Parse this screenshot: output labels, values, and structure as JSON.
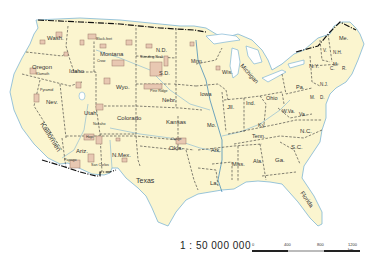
{
  "map": {
    "title": "United States — Indian reservations",
    "colors": {
      "land": "#fbf5cf",
      "water": "#9fd0e6",
      "coast": "#7fb6d4",
      "reservation": "#e8c8b2",
      "reservation_edge": "#9a7a6a",
      "state_border": "#333333",
      "intl_border": "#111111"
    },
    "states": [
      {
        "name": "Wash.",
        "x": 47,
        "y": 40,
        "size": 6
      },
      {
        "name": "Oregon",
        "x": 32,
        "y": 69,
        "size": 6
      },
      {
        "name": "Idaho",
        "x": 69,
        "y": 73,
        "size": 6
      },
      {
        "name": "Montana",
        "x": 100,
        "y": 56,
        "size": 6
      },
      {
        "name": "Wyo.",
        "x": 116,
        "y": 89,
        "size": 6
      },
      {
        "name": "N.D.",
        "x": 156,
        "y": 52,
        "size": 5.5
      },
      {
        "name": "S.D.",
        "x": 159,
        "y": 75,
        "size": 5.5
      },
      {
        "name": "Nebr.",
        "x": 162,
        "y": 102,
        "size": 6
      },
      {
        "name": "Minn.",
        "x": 191,
        "y": 63,
        "size": 5
      },
      {
        "name": "Wis.",
        "x": 222,
        "y": 74,
        "size": 5.5
      },
      {
        "name": "Iowa",
        "x": 200,
        "y": 96,
        "size": 5.5
      },
      {
        "name": "Nev.",
        "x": 46,
        "y": 104,
        "size": 6
      },
      {
        "name": "Utah",
        "x": 84,
        "y": 115,
        "size": 6
      },
      {
        "name": "Colorado",
        "x": 117,
        "y": 120,
        "size": 6
      },
      {
        "name": "Kansas",
        "x": 166,
        "y": 124,
        "size": 6
      },
      {
        "name": "Mo.",
        "x": 207,
        "y": 127,
        "size": 5.5
      },
      {
        "name": "Jll.",
        "x": 227,
        "y": 109,
        "size": 6
      },
      {
        "name": "Ind.",
        "x": 246,
        "y": 105,
        "size": 5.5
      },
      {
        "name": "Ohio",
        "x": 266,
        "y": 100,
        "size": 5.5
      },
      {
        "name": "Pa.",
        "x": 296,
        "y": 89,
        "size": 5.5
      },
      {
        "name": "N.Y.",
        "x": 309,
        "y": 68,
        "size": 5.5
      },
      {
        "name": "Me.",
        "x": 339,
        "y": 40,
        "size": 5.5
      },
      {
        "name": "Ky.",
        "x": 258,
        "y": 127,
        "size": 5.5
      },
      {
        "name": "W.Va.",
        "x": 282,
        "y": 113,
        "size": 5
      },
      {
        "name": "Va.",
        "x": 299,
        "y": 116,
        "size": 5
      },
      {
        "name": "Tenn.",
        "x": 252,
        "y": 138,
        "size": 5.5
      },
      {
        "name": "N.C.",
        "x": 300,
        "y": 133,
        "size": 6
      },
      {
        "name": "S.C.",
        "x": 291,
        "y": 149,
        "size": 6
      },
      {
        "name": "Ga.",
        "x": 275,
        "y": 162,
        "size": 6
      },
      {
        "name": "Ala.",
        "x": 253,
        "y": 163,
        "size": 5.5
      },
      {
        "name": "Miss.",
        "x": 232,
        "y": 166,
        "size": 5.5
      },
      {
        "name": "Ark.",
        "x": 211,
        "y": 152,
        "size": 5.5
      },
      {
        "name": "La.",
        "x": 210,
        "y": 185,
        "size": 6
      },
      {
        "name": "Okla.",
        "x": 169,
        "y": 150,
        "size": 6
      },
      {
        "name": "Texas",
        "x": 136,
        "y": 183,
        "size": 7
      },
      {
        "name": "N.Mex.",
        "x": 112,
        "y": 157,
        "size": 6
      },
      {
        "name": "Ariz.",
        "x": 76,
        "y": 153,
        "size": 6
      }
    ],
    "rotated_labels": [
      {
        "name": "Kalifornien",
        "x": 40,
        "y": 124,
        "rotate": 58,
        "size": 7
      },
      {
        "name": "Michigan",
        "x": 240,
        "y": 66,
        "rotate": 48,
        "size": 6
      },
      {
        "name": "Florida",
        "x": 300,
        "y": 193,
        "rotate": 55,
        "size": 6
      }
    ],
    "small_labels": [
      {
        "name": "V.",
        "x": 323,
        "y": 52
      },
      {
        "name": "N.H.",
        "x": 333,
        "y": 54
      },
      {
        "name": "M.",
        "x": 333,
        "y": 66
      },
      {
        "name": "C.",
        "x": 330,
        "y": 70
      },
      {
        "name": "R.",
        "x": 342,
        "y": 70
      },
      {
        "name": "N.J.",
        "x": 320,
        "y": 86
      },
      {
        "name": "M.",
        "x": 310,
        "y": 99
      },
      {
        "name": "D.",
        "x": 320,
        "y": 99
      }
    ],
    "reservations": [
      {
        "name": "Black-feet",
        "x": 96,
        "y": 40
      },
      {
        "name": "Crow",
        "x": 97,
        "y": 62
      },
      {
        "name": "Klamath",
        "x": 36,
        "y": 75
      },
      {
        "name": "Standing Rock",
        "x": 140,
        "y": 58
      },
      {
        "name": "Pine Ridge",
        "x": 150,
        "y": 92
      },
      {
        "name": "Pyramid",
        "x": 40,
        "y": 91
      },
      {
        "name": "Navaho",
        "x": 93,
        "y": 125
      },
      {
        "name": "Osage",
        "x": 171,
        "y": 140
      },
      {
        "name": "Hopi",
        "x": 86,
        "y": 138
      },
      {
        "name": "San Carlos",
        "x": 91,
        "y": 166
      },
      {
        "name": "Papago",
        "x": 64,
        "y": 161
      }
    ],
    "scale": {
      "ratio": "1 : 50 000 000",
      "ticks": [
        "0",
        "400",
        "800",
        "1200 km"
      ]
    }
  }
}
